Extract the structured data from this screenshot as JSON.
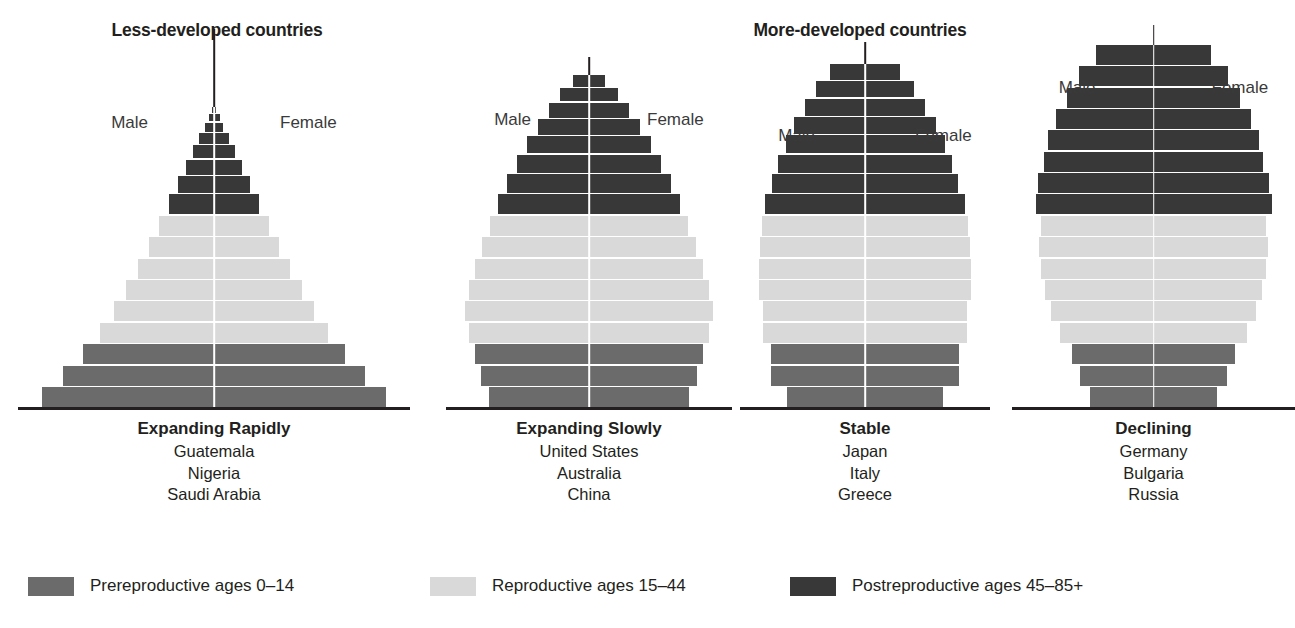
{
  "headers": {
    "less_developed": "Less-developed countries",
    "more_developed": "More-developed countries"
  },
  "sex_labels": {
    "male": "Male",
    "female": "Female"
  },
  "legend": [
    {
      "key": "prereproductive",
      "label": "Prereproductive ages 0–14",
      "color": "#6b6b6b"
    },
    {
      "key": "reproductive",
      "label": "Reproductive ages 15–44",
      "color": "#d9d9d9"
    },
    {
      "key": "postreproductive",
      "label": "Postreproductive ages 45–85+",
      "color": "#383838"
    }
  ],
  "colors": {
    "prereproductive": "#6b6b6b",
    "reproductive": "#d9d9d9",
    "postreproductive": "#383838",
    "axis": "#ffffff",
    "rule": "#231f20",
    "text": "#231f20"
  },
  "chart_data": {
    "type": "bar",
    "subtitle": "Less-developed countries vs More-developed countries",
    "xlabel": "",
    "ylabel": "Age class",
    "orientation": "horizontal-diverging",
    "grid": false,
    "legend_position": "bottom",
    "categories": [
      "0–4",
      "5–9",
      "10–14",
      "15–19",
      "20–24",
      "25–29",
      "30–34",
      "35–39",
      "40–44",
      "45–49",
      "50–54",
      "55–59",
      "60–64",
      "65–69",
      "70–74",
      "75–79",
      "80–85+"
    ],
    "class_of_row": [
      "prereproductive",
      "prereproductive",
      "prereproductive",
      "reproductive",
      "reproductive",
      "reproductive",
      "reproductive",
      "reproductive",
      "reproductive",
      "postreproductive",
      "postreproductive",
      "postreproductive",
      "postreproductive",
      "postreproductive",
      "postreproductive",
      "postreproductive",
      "postreproductive"
    ],
    "pyramids": [
      {
        "id": "expanding-rapidly",
        "group": "Less-developed countries",
        "title": "Expanding Rapidly",
        "countries": [
          "Guatemala",
          "Nigeria",
          "Saudi Arabia"
        ],
        "half_widths_pct": [
          100,
          88,
          76,
          66,
          58,
          51,
          44,
          38,
          32,
          26,
          21,
          16,
          12,
          8.5,
          5.5,
          3.2,
          1.4
        ],
        "row_heights_px": [
          20,
          20,
          20,
          20,
          20,
          20,
          20,
          20,
          20,
          20,
          17,
          15,
          13,
          11,
          9,
          7,
          6
        ],
        "spire_height_px": 78
      },
      {
        "id": "expanding-slowly",
        "group": "More-developed countries",
        "title": "Expanding Slowly",
        "countries": [
          "United States",
          "Australia",
          "China"
        ],
        "half_widths_pct": [
          81,
          87,
          92,
          97,
          100,
          97,
          92,
          86,
          80,
          73,
          66,
          58,
          50,
          41,
          32,
          23,
          13
        ],
        "row_heights_px": [
          20,
          20,
          20,
          20,
          20,
          20,
          20,
          20,
          20,
          20,
          19,
          18,
          17,
          16,
          15,
          13,
          12
        ],
        "spire_height_px": 18
      },
      {
        "id": "stable",
        "group": "More-developed countries",
        "title": "Stable",
        "countries": [
          "Japan",
          "Italy",
          "Greece"
        ],
        "half_widths_pct": [
          74,
          89,
          89,
          96,
          96,
          100,
          100,
          99,
          97,
          94,
          88,
          82,
          75,
          67,
          57,
          46,
          33
        ],
        "row_heights_px": [
          20,
          20,
          20,
          20,
          20,
          20,
          20,
          20,
          20,
          20,
          19,
          18,
          18,
          17,
          17,
          16,
          16
        ],
        "spire_height_px": 22
      },
      {
        "id": "declining",
        "group": "More-developed countries",
        "title": "Declining",
        "countries": [
          "Germany",
          "Bulgaria",
          "Russia"
        ],
        "half_widths_pct": [
          54,
          62,
          69,
          79,
          87,
          92,
          95,
          97,
          95,
          100,
          98,
          93,
          89,
          83,
          73,
          63,
          49
        ],
        "row_heights_px": [
          20,
          20,
          20,
          20,
          20,
          20,
          20,
          20,
          20,
          20,
          20,
          20,
          20,
          20,
          20,
          20,
          20
        ],
        "spire_height_px": 20
      }
    ]
  }
}
